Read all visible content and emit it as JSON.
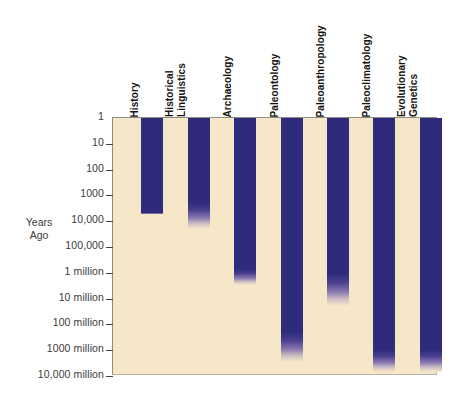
{
  "chart_data": {
    "type": "bar",
    "title": "",
    "subtitle": "",
    "xlabel": "",
    "ylabel": "Years\nAgo",
    "ylabel_lines": [
      "Years",
      "Ago"
    ],
    "orientation": "vertical-downward",
    "scale": "log",
    "grid": false,
    "legend": null,
    "axis_note": "Bars hang from the top (1 year ago) downward to the oldest time each discipline can reach; ends fade out to show uncertainty.",
    "ytick_labels": [
      "1",
      "10",
      "100",
      "1000",
      "10,000",
      "100,000",
      "1 million",
      "10 million",
      "100 million",
      "1000 million",
      "10,000 million"
    ],
    "ytick_values": [
      1,
      10,
      100,
      1000,
      10000,
      100000,
      1000000,
      10000000,
      100000000,
      1000000000,
      10000000000
    ],
    "ylim": [
      1,
      10000000000
    ],
    "categories": [
      "History",
      "Historical Linguistics",
      "Archaeology",
      "Paleontology",
      "Paleoanthropology",
      "Paleoclimatology",
      "Evolutionary Genetics"
    ],
    "series": [
      {
        "name": "Temporal reach (years ago)",
        "values": [
          5000,
          20000,
          3000000,
          3000000000,
          20000000,
          10000000000,
          10000000000
        ],
        "solid_values": [
          5000,
          2000,
          700000,
          200000000,
          1000000,
          1000000000,
          1000000000
        ]
      }
    ],
    "bars": [
      {
        "label": "History",
        "label_lines": [
          "History"
        ],
        "start": 1,
        "solid_to": 5000,
        "fade_to": 5500
      },
      {
        "label": "Historical Linguistics",
        "label_lines": [
          "Historical",
          "Linguistics"
        ],
        "start": 1,
        "solid_to": 2000,
        "fade_to": 20000
      },
      {
        "label": "Archaeology",
        "label_lines": [
          "Archaeology"
        ],
        "start": 1,
        "solid_to": 700000,
        "fade_to": 3000000
      },
      {
        "label": "Paleontology",
        "label_lines": [
          "Paleontology"
        ],
        "start": 1,
        "solid_to": 200000000,
        "fade_to": 3000000000
      },
      {
        "label": "Paleoanthropology",
        "label_lines": [
          "Paleoanthropology"
        ],
        "start": 1,
        "solid_to": 1000000,
        "fade_to": 20000000
      },
      {
        "label": "Paleoclimatology",
        "label_lines": [
          "Paleoclimatology"
        ],
        "start": 1,
        "solid_to": 1000000000,
        "fade_to": 7000000000
      },
      {
        "label": "Evolutionary Genetics",
        "label_lines": [
          "Evolutionary",
          "Genetics"
        ],
        "start": 1,
        "solid_to": 1000000000,
        "fade_to": 7000000000
      }
    ],
    "colors": {
      "bar": "#2e2b7d",
      "plot_background": "#f6e7c9",
      "page_background": "#ffffff",
      "axis_text": "#3b3a38",
      "header_text": "#15140f",
      "border": "#8f8c84"
    }
  }
}
